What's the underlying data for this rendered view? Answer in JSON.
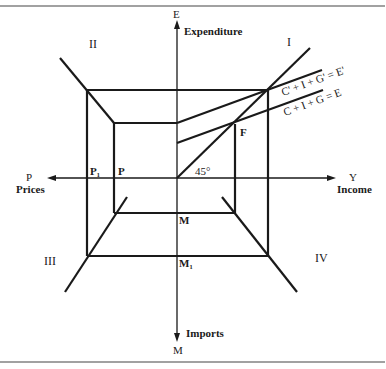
{
  "diagram": {
    "type": "four-quadrant diagram",
    "axes": {
      "vertical_up": {
        "symbol": "E",
        "label": "Expenditure"
      },
      "vertical_down": {
        "symbol": "M",
        "label": "Imports"
      },
      "horizontal_right": {
        "symbol": "Y",
        "label": "Income"
      },
      "horizontal_left": {
        "symbol": "P",
        "label": "Prices"
      }
    },
    "quadrants": {
      "q1": "I",
      "q2": "II",
      "q3": "III",
      "q4": "IV"
    },
    "curves": {
      "upper": "C' + I + G' = E'",
      "lower": "C + I + G = E",
      "angle": "45°"
    },
    "points": {
      "equilibrium": "F",
      "price_inner": "P",
      "price_outer": "P₁",
      "imports_inner": "M",
      "imports_outer": "M₁"
    }
  }
}
